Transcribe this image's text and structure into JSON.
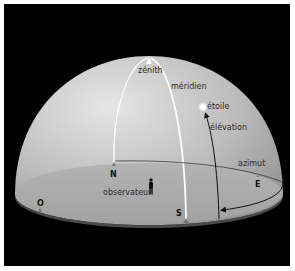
{
  "diagram": {
    "colors": {
      "background": "#000000",
      "frame": "#ffffff",
      "dome_light": "#e4e4e4",
      "dome_mid": "#b9b9b9",
      "dome_dark": "#8f8f8f",
      "ground": "#a9a9a9",
      "meridian_line": "#ffffff",
      "elevation_arrow": "#111111",
      "azimuth_arrow": "#111111",
      "star": "#ffffff"
    },
    "labels": {
      "zenith": "zénith",
      "meridian": "méridien",
      "star": "étoile",
      "elevation": "élévation",
      "azimuth": "azimut",
      "observer": "observateur"
    },
    "cardinal_points": {
      "north": "N",
      "south": "S",
      "east": "E",
      "west": "O"
    },
    "icons": {
      "zenith_marker": "triangle-up",
      "cardinal_marker": "small-triangle",
      "observer": "person-silhouette",
      "star": "glowing-dot"
    }
  }
}
